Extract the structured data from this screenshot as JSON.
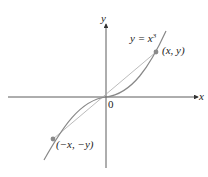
{
  "diagram": {
    "curve_label": "y = x",
    "curve_exponent": "3",
    "axis_x_label": "x",
    "axis_y_label": "y",
    "origin_label": "0",
    "point_p_label": "(x, y)",
    "point_q_label": "(−x, −y)",
    "colors": {
      "axis": "#333333",
      "curve": "#888888",
      "chord": "#aaaaaa",
      "point": "#8a8a8a"
    }
  }
}
